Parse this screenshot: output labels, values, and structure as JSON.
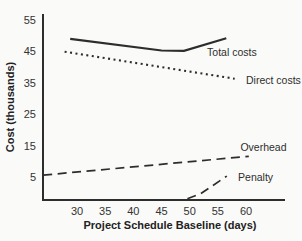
{
  "figure": {
    "background": "#fafaf8",
    "ink_color": "#2d2d2d"
  },
  "chart_data": {
    "type": "line",
    "title": "",
    "xlabel": "Project Schedule Baseline (days)",
    "ylabel": "Cost (thousands)",
    "x_ticks": [
      30,
      35,
      40,
      45,
      50,
      55,
      60
    ],
    "y_ticks": [
      5,
      15,
      25,
      35,
      45,
      55
    ],
    "xlim": [
      24,
      67
    ],
    "ylim": [
      -2.5,
      57
    ],
    "grid": false,
    "legend_position": "inline-labels-right-of-lines",
    "series": [
      {
        "name": "Total costs",
        "style": "solid",
        "points": [
          [
            28.8,
            49.0
          ],
          [
            45.0,
            45.3
          ],
          [
            49.0,
            45.2
          ],
          [
            56.5,
            49.2
          ]
        ],
        "label_at": [
          53.1,
          43.5
        ]
      },
      {
        "name": "Direct costs",
        "style": "dotted",
        "points": [
          [
            27.8,
            44.9
          ],
          [
            58.0,
            36.3
          ]
        ],
        "label_at": [
          60.0,
          34.6
        ]
      },
      {
        "name": "Overhead",
        "style": "dashed",
        "points": [
          [
            24.0,
            5.6
          ],
          [
            60.5,
            11.6
          ]
        ],
        "label_at": [
          59.0,
          13.3
        ]
      },
      {
        "name": "Penalty",
        "style": "dashed",
        "points": [
          [
            49.6,
            -1.9
          ],
          [
            52.0,
            -0.3
          ],
          [
            56.6,
            5.3
          ]
        ],
        "label_at": [
          58.6,
          3.7
        ]
      }
    ]
  }
}
